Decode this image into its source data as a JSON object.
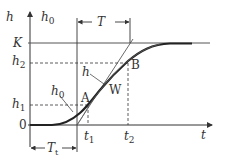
{
  "diagram": {
    "colors": {
      "line": "#333333",
      "curve": "#222222",
      "background": "#ffffff"
    },
    "axes": {
      "y_label": "h",
      "x_label": "t",
      "origin_label": "0"
    },
    "levels": {
      "K": "K",
      "h2": "h",
      "h2_sub": "2",
      "h1": "h",
      "h1_sub": "1"
    },
    "times": {
      "t1": "t",
      "t1_sub": "1",
      "t2": "t",
      "t2_sub": "2"
    },
    "curve_labels": {
      "h0_top": "h",
      "h0_top_sub": "0",
      "h0_curve": "h",
      "h0_curve_sub": "0",
      "h_tangent": "h"
    },
    "points": {
      "A": "A",
      "B": "B",
      "W": "W"
    },
    "intervals": {
      "T": "T",
      "Tt": "T",
      "Tt_sub": "t"
    }
  }
}
